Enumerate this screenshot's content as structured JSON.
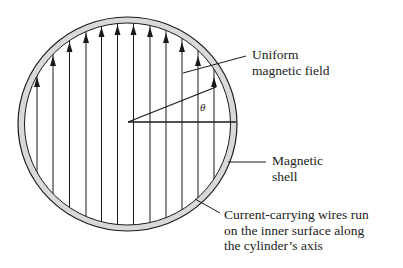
{
  "diagram": {
    "type": "cross-section",
    "labels": {
      "field": [
        "Uniform",
        "magnetic field"
      ],
      "shell": [
        "Magnetic",
        "shell"
      ],
      "wires": [
        "Current-carrying wires run",
        "on the inner surface along",
        "the cylinder’s axis"
      ],
      "angle": "θ"
    },
    "colors": {
      "stroke": "#1a1a1a",
      "shell_fill": "#d9d9d9",
      "background": "#ffffff"
    },
    "field_line_count": 12
  }
}
